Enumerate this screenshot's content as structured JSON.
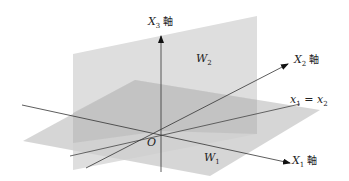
{
  "figure": {
    "type": "3d-subspace-diagram",
    "planes": {
      "W1": {
        "label": "W",
        "sub": "1",
        "description": "horizontal plane"
      },
      "W2": {
        "label": "W",
        "sub": "2",
        "description": "vertical plane"
      }
    },
    "axes": {
      "X1": {
        "label": "X",
        "sub": "1",
        "suffix": "軸"
      },
      "X2": {
        "label": "X",
        "sub": "2",
        "suffix": "軸"
      },
      "X3": {
        "label": "X",
        "sub": "3",
        "suffix": "軸"
      }
    },
    "line": {
      "label_left": "x",
      "sub_left": "1",
      "eq": " = ",
      "label_right": "x",
      "sub_right": "2"
    },
    "origin": {
      "label": "O"
    },
    "colors": {
      "vertical_plane": "#dcdcdc",
      "horizontal_plane": "#cfcfcf",
      "overlap": "#b9b9b9",
      "axis": "#333333"
    }
  }
}
